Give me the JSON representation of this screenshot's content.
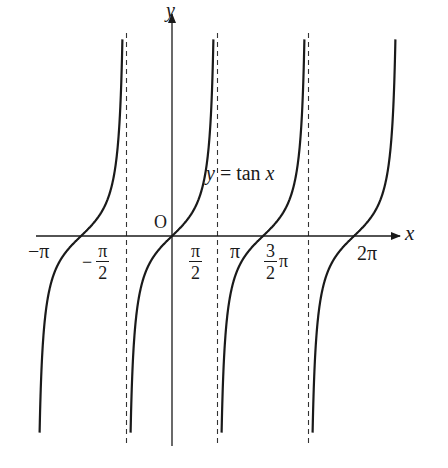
{
  "chart_data": {
    "type": "line",
    "title": "",
    "function_label": "y = tan x",
    "xlabel": "x",
    "ylabel": "y",
    "origin_label": "O",
    "x_tick_labels": [
      "-π",
      "-π/2",
      "π/2",
      "π",
      "3/2 π",
      "2π"
    ],
    "x_tick_values": [
      -3.14159,
      -1.5708,
      1.5708,
      3.14159,
      4.71239,
      6.28319
    ],
    "asymptotes": [
      -1.5708,
      1.5708,
      4.71239
    ],
    "branches": [
      {
        "name": "branch centered at -π",
        "x_range": [
          -4.55,
          -1.62
        ],
        "zero": -3.14159
      },
      {
        "name": "branch centered at 0",
        "x_range": [
          -1.41,
          1.52
        ],
        "zero": 0
      },
      {
        "name": "branch centered at π",
        "x_range": [
          1.73,
          4.66
        ],
        "zero": 3.14159
      },
      {
        "name": "branch centered at 2π",
        "x_range": [
          4.87,
          7.8
        ],
        "zero": 6.28319
      }
    ],
    "xlim": [
      -4.2,
      7.1
    ],
    "ylim": [
      -7.5,
      7.0
    ],
    "grid": false,
    "legend": "none",
    "line_color": "#1a1a1a",
    "asymptote_style": "dashed"
  },
  "layout": {
    "origin_px": [
      172,
      236
    ],
    "pi_px": 91,
    "y_unit_px": 28,
    "y_top_px": 33,
    "y_bottom_px": 443,
    "x_axis_start_px": 36,
    "x_axis_end_px": 400,
    "y_axis_top_px": 14,
    "y_axis_bottom_px": 446
  },
  "labels": {
    "y_axis": "y",
    "x_axis": "x",
    "origin": "O",
    "function_y": "y",
    "function_eq": " = tan ",
    "function_x": "x",
    "neg_pi": "−π",
    "neg_half_pi_sign": "−",
    "pi_sym": "π",
    "two": "2",
    "three": "3",
    "pi": "π",
    "two_pi": "2π"
  }
}
